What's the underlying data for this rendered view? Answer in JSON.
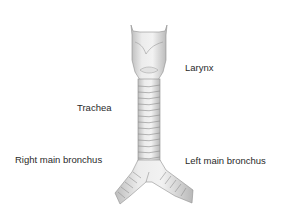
{
  "diagram": {
    "labels": {
      "larynx": "Larynx",
      "trachea": "Trachea",
      "right_bronchus": "Right main bronchus",
      "left_bronchus": "Left main bronchus"
    }
  }
}
